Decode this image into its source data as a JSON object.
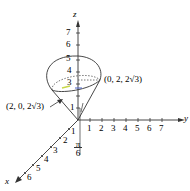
{
  "axes": {
    "x_label": "x",
    "y_label": "y",
    "z_label": "z",
    "z_ticks": [
      "1",
      "2",
      "3",
      "4",
      "5",
      "6",
      "7"
    ],
    "y_ticks": [
      "1",
      "2",
      "3",
      "4",
      "5",
      "6",
      "7"
    ],
    "x_ticks": [
      "1",
      "2",
      "3",
      "4",
      "5",
      "6"
    ]
  },
  "annotations": {
    "point_right": "(0, 2, 2√3)",
    "point_left": "(2, 0, 2√3)",
    "angle_num": "π",
    "angle_den": "6",
    "label_one": "1"
  },
  "colors": {
    "line": "#333333",
    "text": "#222222",
    "accent_highlight": "#c8d84a",
    "blue_accent": "#4a62c8"
  }
}
